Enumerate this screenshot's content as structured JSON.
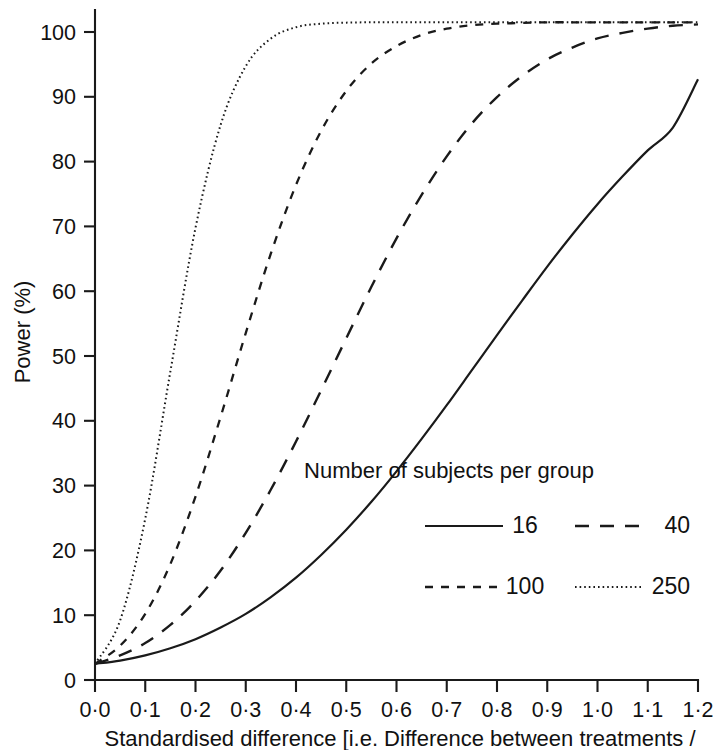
{
  "chart_data": {
    "type": "line",
    "title": "",
    "xlabel": "Standardised difference [i.e. Difference between treatments /",
    "ylabel": "Power (%)",
    "xlim": [
      0.0,
      1.2
    ],
    "ylim": [
      0,
      100
    ],
    "grid": false,
    "legend_position": "inside-lower-right",
    "legend_title": "Number of subjects per group",
    "x_tick_labels": [
      "0·0",
      "0·1",
      "0·2",
      "0·3",
      "0·4",
      "0·5",
      "0·6",
      "0·7",
      "0·8",
      "0·9",
      "1·0",
      "1·1",
      "1·2"
    ],
    "x_tick_values": [
      0.0,
      0.1,
      0.2,
      0.3,
      0.4,
      0.5,
      0.6,
      0.7,
      0.8,
      0.9,
      1.0,
      1.1,
      1.2
    ],
    "y_tick_labels": [
      "0",
      "10",
      "20",
      "30",
      "40",
      "50",
      "60",
      "70",
      "80",
      "90",
      "100"
    ],
    "y_tick_values": [
      0,
      10,
      20,
      30,
      40,
      50,
      60,
      70,
      80,
      90,
      100
    ],
    "plateau_value": 101.5,
    "x": [
      0.0,
      0.05,
      0.1,
      0.15,
      0.2,
      0.25,
      0.3,
      0.35,
      0.4,
      0.45,
      0.5,
      0.55,
      0.6,
      0.65,
      0.7,
      0.75,
      0.8,
      0.85,
      0.9,
      0.95,
      1.0,
      1.05,
      1.1,
      1.15,
      1.2
    ],
    "series": [
      {
        "name": "16",
        "label": "16",
        "dash": "none",
        "stroke_width": 2.2,
        "values": [
          2.5,
          3.0,
          3.8,
          4.9,
          6.3,
          8.1,
          10.2,
          12.8,
          15.8,
          19.3,
          23.2,
          27.5,
          32.2,
          37.2,
          42.4,
          47.8,
          53.2,
          58.5,
          63.7,
          68.6,
          73.2,
          77.4,
          81.3,
          84.7,
          91.8
        ]
      },
      {
        "name": "40",
        "label": "40",
        "dash": "14 11",
        "stroke_width": 2.4,
        "values": [
          2.5,
          3.8,
          5.7,
          8.5,
          12.2,
          16.9,
          22.7,
          29.4,
          36.8,
          44.7,
          52.7,
          60.6,
          68.0,
          74.6,
          80.4,
          85.3,
          89.2,
          92.3,
          94.7,
          96.4,
          97.7,
          98.5,
          99.1,
          99.5,
          99.7
        ]
      },
      {
        "name": "100",
        "label": "100",
        "dash": "8 8",
        "stroke_width": 2.3,
        "values": [
          2.5,
          5.3,
          10.2,
          17.9,
          28.3,
          40.6,
          53.5,
          65.7,
          76.1,
          84.2,
          90.1,
          94.1,
          96.6,
          98.2,
          99.1,
          99.6,
          99.8,
          99.9,
          100.0,
          100.0,
          100.0,
          100.0,
          100.0,
          100.0,
          100.0
        ]
      },
      {
        "name": "250",
        "label": "250",
        "dash": "1.6 3.0",
        "stroke_width": 2.0,
        "values": [
          2.5,
          9.2,
          24.9,
          47.6,
          69.6,
          85.1,
          93.7,
          97.7,
          99.3,
          99.8,
          99.95,
          100.0,
          100.0,
          100.0,
          100.0,
          100.0,
          100.0,
          100.0,
          100.0,
          100.0,
          100.0,
          100.0,
          100.0,
          100.0,
          100.0
        ]
      }
    ]
  },
  "axes": {
    "y_axis_label": "Power (%)"
  },
  "legend": {
    "title": "Number of subjects per group",
    "entries": [
      {
        "label": "16"
      },
      {
        "label": "40"
      },
      {
        "label": "100"
      },
      {
        "label": "250"
      }
    ]
  },
  "caption": {
    "line1": "Standardised difference [i.e. Difference between treatments /"
  },
  "colors": {
    "ink": "#1a1a1a",
    "background": "#ffffff"
  }
}
